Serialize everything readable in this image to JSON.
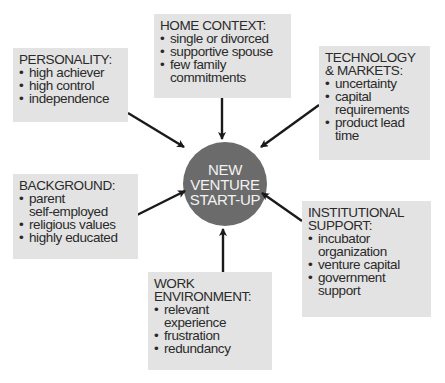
{
  "diagram": {
    "hub": {
      "label": "NEW\nVENTURE\nSTART-UP",
      "color": "#6b6b6b",
      "text_color": "#f2f2f2"
    },
    "box_color": "#e3e3e3",
    "arrow_color": "#1a1a1a",
    "factors": [
      {
        "id": "home-context",
        "title": "HOME CONTEXT:",
        "items": [
          "single or divorced",
          "supportive spouse",
          "few family\ncommitments"
        ]
      },
      {
        "id": "personality",
        "title": "PERSONALITY:",
        "items": [
          "high achiever",
          "high control",
          "independence"
        ]
      },
      {
        "id": "technology-markets",
        "title": "TECHNOLOGY\n& MARKETS:",
        "items": [
          "uncertainty",
          "capital\nrequirements",
          "product lead\ntime"
        ]
      },
      {
        "id": "background",
        "title": "BACKGROUND:",
        "items": [
          "parent\nself-employed",
          "religious values",
          "highly educated"
        ]
      },
      {
        "id": "work-environment",
        "title": "WORK\nENVIRONMENT:",
        "items": [
          "relevant\nexperience",
          "frustration",
          "redundancy"
        ]
      },
      {
        "id": "institutional-support",
        "title": "INSTITUTIONAL\nSUPPORT:",
        "items": [
          "incubator\norganization",
          "venture capital",
          "government\nsupport"
        ]
      }
    ]
  }
}
